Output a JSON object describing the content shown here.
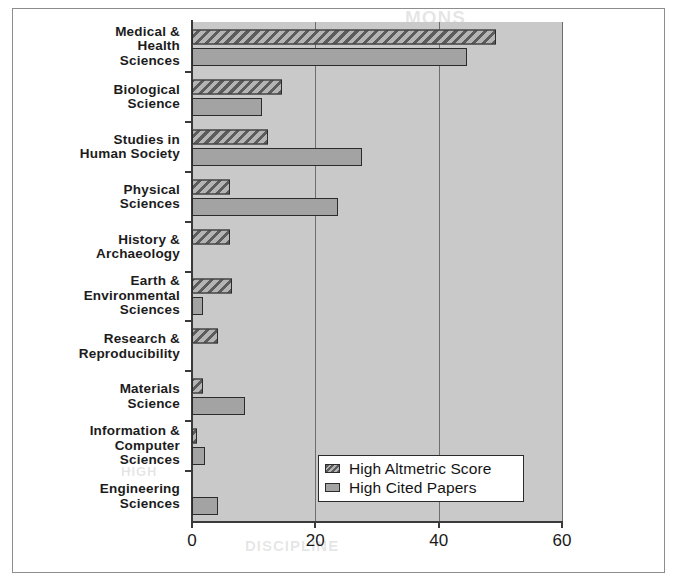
{
  "chart_data": {
    "type": "bar",
    "orientation": "horizontal",
    "title": "",
    "xlabel": "",
    "ylabel": "",
    "xlim": [
      0,
      60
    ],
    "xticks": [
      0,
      20,
      40,
      60
    ],
    "xticklabels": [
      "0",
      "20",
      "40",
      "60"
    ],
    "grid": true,
    "grid_axis": "x",
    "legend_position": "lower right",
    "categories": [
      "Medical &\nHealth\nSciences",
      "Biological\nScience",
      "Studies in\nHuman Society",
      "Physical\nSciences",
      "History &\nArchaeology",
      "Earth &\nEnvironmental\nSciences",
      "Research &\nReproducibility",
      "Materials\nScience",
      "Information &\nComputer\nSciences",
      "Engineering\nSciences"
    ],
    "series": [
      {
        "name": "High Altmetric Score",
        "pattern": "diagonal-hatch",
        "color": "#7a7a7a",
        "values": [
          49.3,
          14.6,
          12.4,
          6.2,
          6.2,
          6.5,
          4.2,
          1.8,
          0.8,
          0.0
        ]
      },
      {
        "name": "High Cited Papers",
        "pattern": "solid",
        "color": "#a3a3a3",
        "values": [
          44.6,
          11.3,
          27.5,
          23.7,
          0.0,
          1.8,
          0.0,
          8.6,
          2.1,
          4.2
        ]
      }
    ]
  },
  "legend": {
    "items": [
      {
        "label": "High Altmetric Score"
      },
      {
        "label": "High Cited Papers"
      }
    ]
  },
  "ghost_text": {
    "top": "MONS",
    "bottom": "DISCIPLINE",
    "middle": "HIGH"
  }
}
